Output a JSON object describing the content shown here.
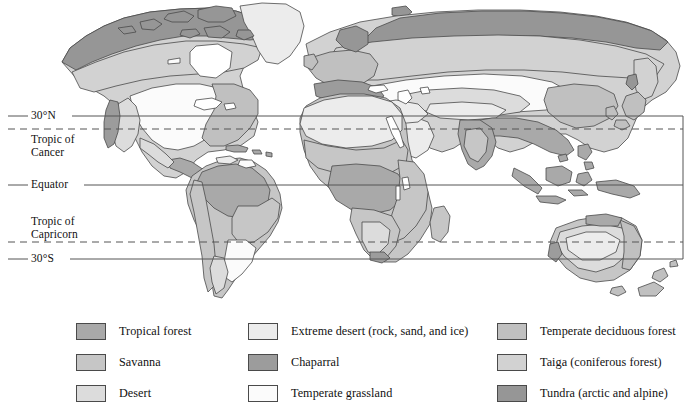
{
  "map": {
    "title": "World biome distribution map",
    "latitude_lines": [
      {
        "id": "30n",
        "label": "30°N",
        "style": "solid",
        "y": 116
      },
      {
        "id": "tropic_of_cancer",
        "label": "Tropic of\nCancer",
        "style": "dashed",
        "y": 129
      },
      {
        "id": "equator",
        "label": "Equator",
        "style": "solid",
        "y": 185
      },
      {
        "id": "tropic_of_capricorn",
        "label": "Tropic of\nCapricorn",
        "style": "dashed",
        "y": 242
      },
      {
        "id": "30s",
        "label": "30°S",
        "style": "solid",
        "y": 259
      }
    ],
    "label_30n": "30°N",
    "label_cancer_line1": "Tropic of",
    "label_cancer_line2": "Cancer",
    "label_equator": "Equator",
    "label_capricorn_line1": "Tropic of",
    "label_capricorn_line2": "Capricorn",
    "label_30s": "30°S"
  },
  "legend": {
    "columns": [
      {
        "items": [
          {
            "label": "Tropical forest",
            "color": "#a9a9a9"
          },
          {
            "label": "Savanna",
            "color": "#c6c6c6"
          },
          {
            "label": "Desert",
            "color": "#dcdcdc"
          }
        ]
      },
      {
        "items": [
          {
            "label": "Extreme desert (rock, sand, and ice)",
            "color": "#ececec"
          },
          {
            "label": "Chaparral",
            "color": "#9c9c9c"
          },
          {
            "label": "Temperate grassland",
            "color": "#fbfbfb"
          }
        ]
      },
      {
        "items": [
          {
            "label": "Temperate deciduous forest",
            "color": "#c0c0c0"
          },
          {
            "label": "Taiga (coniferous forest)",
            "color": "#d2d2d2"
          },
          {
            "label": "Tundra (arctic and alpine)",
            "color": "#969696"
          }
        ]
      }
    ]
  },
  "colors": {
    "tropical_forest": "#a9a9a9",
    "savanna": "#c6c6c6",
    "desert": "#dcdcdc",
    "extreme_desert": "#ececec",
    "chaparral": "#9c9c9c",
    "temperate_grassland": "#fbfbfb",
    "temperate_deciduous_forest": "#c0c0c0",
    "taiga": "#d2d2d2",
    "tundra": "#969696",
    "coastline": "#4a4a4a",
    "grid_line": "#555555",
    "background": "#ffffff"
  }
}
